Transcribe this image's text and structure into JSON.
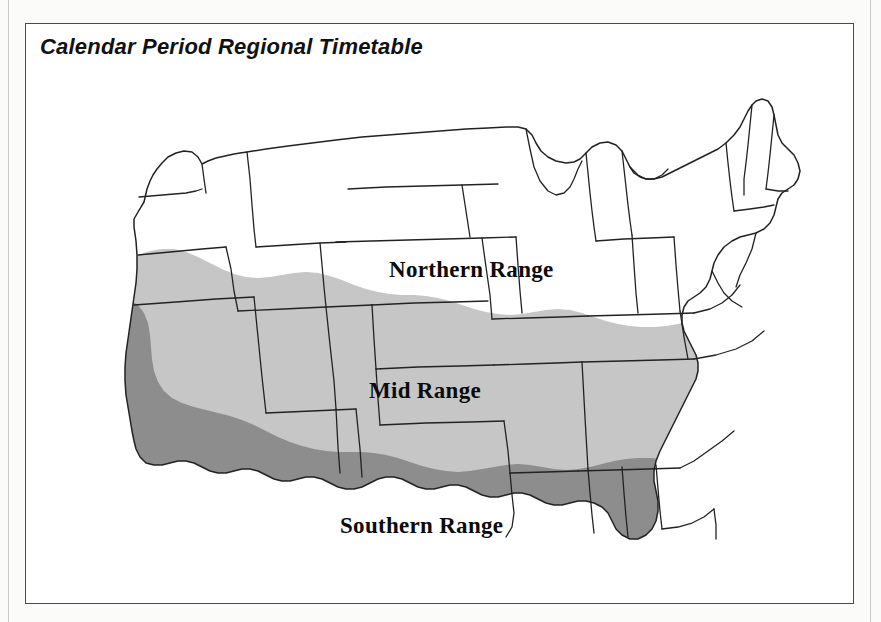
{
  "panel": {
    "title": "Calendar Period Regional Timetable",
    "border_color": "#4a4a4a",
    "background_color": "#ffffff"
  },
  "page": {
    "background_color": "#fbfbfa",
    "scan_rule_color": "#c9c9c9"
  },
  "map": {
    "type": "choropleth",
    "subject": "United States regional planting/calendar zones",
    "outline_color": "#222222",
    "regions": [
      {
        "key": "northern",
        "label": "Northern Range",
        "fill_color": "#ffffff",
        "shade": "white",
        "label_x": 363,
        "label_y": 188
      },
      {
        "key": "mid",
        "label": "Mid Range",
        "fill_color": "#c6c6c6",
        "shade": "light-gray",
        "label_x": 343,
        "label_y": 309
      },
      {
        "key": "southern",
        "label": "Southern Range",
        "fill_color": "#8d8d8d",
        "shade": "dark-gray",
        "label_x": 314,
        "label_y": 444
      }
    ]
  }
}
